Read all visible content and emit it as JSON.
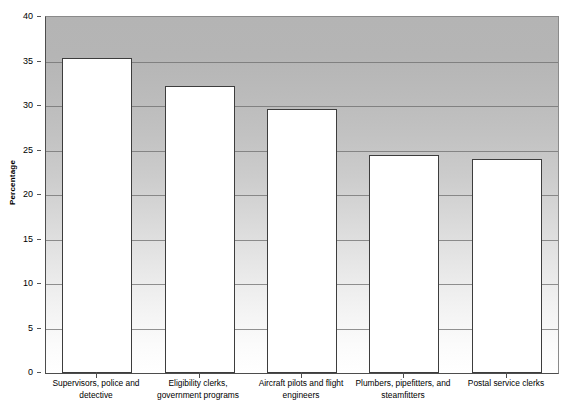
{
  "chart_data": {
    "type": "bar",
    "title": "",
    "subtitle": "",
    "xlabel": "",
    "ylabel": "Percentage",
    "ylim": [
      0,
      40
    ],
    "ytick_values": [
      0,
      5,
      10,
      15,
      20,
      25,
      30,
      35,
      40
    ],
    "ytick_labels": [
      "0",
      "5",
      "10",
      "15",
      "20",
      "25",
      "30",
      "35",
      "40"
    ],
    "grid": true,
    "legend": false,
    "legend_position": "none",
    "categories": [
      "Supervisors, police and detective",
      "Eligibility clerks, government programs",
      "Aircraft pilots and flight engineers",
      "Plumbers, pipefitters, and steamfitters",
      "Postal service clerks"
    ],
    "category_lines": [
      [
        "Supervisors, police and",
        "detective"
      ],
      [
        "Eligibility clerks,",
        "government programs"
      ],
      [
        "Aircraft pilots and flight",
        "engineers"
      ],
      [
        "Plumbers, pipefitters, and",
        "steamfitters"
      ],
      [
        "Postal service clerks"
      ]
    ],
    "values": [
      35.4,
      32.2,
      29.7,
      24.5,
      24.0
    ],
    "series": [
      {
        "name": "Percentage",
        "values": [
          35.4,
          32.2,
          29.7,
          24.5,
          24.0
        ]
      }
    ]
  },
  "style": {
    "bar_fill": "#ffffff",
    "bar_border": "#3d3d3d",
    "plot_bg_top": "#b4b4b4",
    "plot_bg_bottom": "#ffffff",
    "gridline_color": "#6e6e6e",
    "axis_color": "#4d4d4d",
    "text_color": "#000000"
  }
}
